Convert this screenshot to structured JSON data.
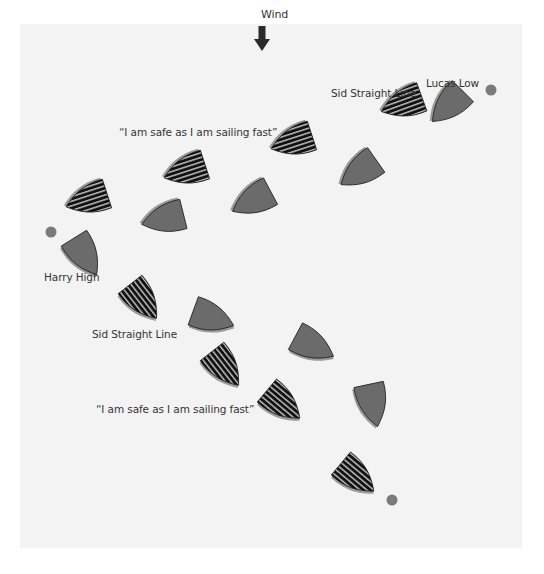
{
  "diagram": {
    "wind": {
      "label": "Wind",
      "x": 261,
      "y": 8,
      "arrow_x": 262,
      "arrow_y": 26
    },
    "labels": [
      {
        "id": "quote-top",
        "text": "“I am safe as I am sailing fast”",
        "x": 119,
        "y": 126
      },
      {
        "id": "sid-top",
        "text": "Sid Straight Line",
        "x": 331,
        "y": 87
      },
      {
        "id": "lucas-low",
        "text": "Lucas Low",
        "x": 426,
        "y": 77
      },
      {
        "id": "harry-high",
        "text": "Harry High",
        "x": 44,
        "y": 271
      },
      {
        "id": "sid-bottom",
        "text": "Sid Straight Line",
        "x": 92,
        "y": 328
      },
      {
        "id": "quote-bottom",
        "text": "“I am safe as I am sailing fast”",
        "x": 96,
        "y": 403
      }
    ],
    "marks": [
      {
        "id": "mark-top-right",
        "x": 491,
        "y": 90
      },
      {
        "id": "mark-left",
        "x": 51,
        "y": 232
      },
      {
        "id": "mark-bottom",
        "x": 392,
        "y": 500
      }
    ],
    "boats": [
      {
        "id": "striped-1",
        "style": "striped",
        "x": 87,
        "y": 200,
        "rot": 72
      },
      {
        "id": "striped-2",
        "style": "striped",
        "x": 185,
        "y": 171,
        "rot": 72
      },
      {
        "id": "striped-3",
        "style": "striped",
        "x": 292,
        "y": 142,
        "rot": 72
      },
      {
        "id": "striped-4-sid",
        "style": "striped",
        "x": 402,
        "y": 104,
        "rot": 70
      },
      {
        "id": "gray-lucas",
        "style": "gray",
        "x": 448,
        "y": 106,
        "rot": 45
      },
      {
        "id": "gray-2",
        "style": "gray",
        "x": 163,
        "y": 219,
        "rot": 76
      },
      {
        "id": "gray-3",
        "style": "gray",
        "x": 252,
        "y": 201,
        "rot": 62
      },
      {
        "id": "gray-4",
        "style": "gray",
        "x": 359,
        "y": 172,
        "rot": 55
      },
      {
        "id": "gray-harry",
        "style": "gray",
        "x": 85,
        "y": 256,
        "rot": -32
      },
      {
        "id": "striped-5-sid",
        "style": "striped",
        "x": 143,
        "y": 301,
        "rot": -38
      },
      {
        "id": "gray-5",
        "style": "gray",
        "x": 213,
        "y": 318,
        "rot": -70
      },
      {
        "id": "striped-6",
        "style": "striped",
        "x": 225,
        "y": 368,
        "rot": -38
      },
      {
        "id": "gray-6",
        "style": "gray",
        "x": 314,
        "y": 346,
        "rot": -62
      },
      {
        "id": "gray-7",
        "style": "gray",
        "x": 373,
        "y": 405,
        "rot": -12
      },
      {
        "id": "striped-7",
        "style": "striped",
        "x": 283,
        "y": 404,
        "rot": -50
      },
      {
        "id": "striped-8",
        "style": "striped",
        "x": 357,
        "y": 477,
        "rot": -50
      }
    ],
    "colors": {
      "background": "#ffffff",
      "panel": "#f3f3f3",
      "boat_gray": "#6b6b6b",
      "boat_shadow": "#9a9a9a",
      "boat_edge": "#1e1e1e",
      "stripe_dark": "#111111",
      "stripe_light": "#bdbdbd",
      "mark": "#7a7a7a",
      "arrow": "#2a2a2a",
      "text": "#333333"
    }
  }
}
